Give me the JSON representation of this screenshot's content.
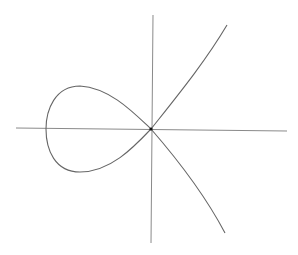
{
  "diagram": {
    "type": "algebraic-curve-plot",
    "colors": {
      "background": "#ffffff",
      "axis": "#8a8a8a",
      "curve": "#666666",
      "node": "#111111"
    },
    "axes": {
      "horizontal": {
        "x1": 16,
        "y1": 128,
        "x2": 287,
        "y2": 131
      },
      "vertical": {
        "x1": 153,
        "y1": 15,
        "x2": 151,
        "y2": 243
      }
    },
    "origin": {
      "x": 151,
      "y": 129
    },
    "curve_path": "M 227 25 C 205 62, 178 95, 151 129 C 133 112, 110 88, 80 86 C 55 86, 46 110, 46 129 C 46 150, 55 172, 80 172 C 110 172, 133 148, 151 129 C 178 160, 205 195, 225 233",
    "labels": []
  }
}
